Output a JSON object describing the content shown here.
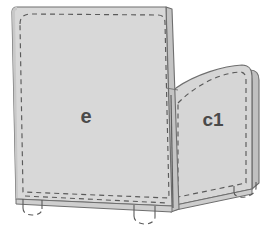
{
  "diagram": {
    "type": "technical-line-drawing",
    "background_color": "#ffffff",
    "panel_fill": "#d6d6d6",
    "panel_fill_light": "#dddddd",
    "edge_fill": "#c4c4c4",
    "outline_color": "#6e6e6e",
    "dashed_color": "#5a5a5a",
    "label_color": "#4a4a4a",
    "panels": [
      {
        "id": "panel-e",
        "label": "e",
        "label_x": 86,
        "label_y": 118,
        "label_size": 20,
        "description": "large left back panel"
      },
      {
        "id": "panel-c1",
        "label": "c1",
        "label_x": 213,
        "label_y": 121,
        "label_size": 19,
        "description": "right side arm panel"
      }
    ],
    "feet": [
      {
        "id": "foot-left",
        "x": 20,
        "y": 205,
        "width": 21,
        "height": 10
      },
      {
        "id": "foot-mid",
        "x": 133,
        "y": 215,
        "width": 22,
        "height": 11
      },
      {
        "id": "foot-right",
        "x": 234,
        "y": 186,
        "width": 22,
        "height": 10
      }
    ]
  }
}
